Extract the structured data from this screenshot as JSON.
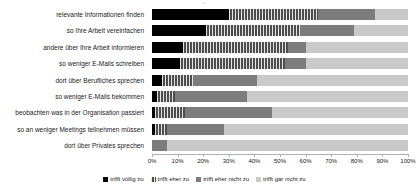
{
  "chart_data": {
    "type": "bar",
    "orientation": "horizontal",
    "stacked": true,
    "stack_mode": "percent",
    "title": "",
    "xlabel": "",
    "ylabel": "",
    "xlim": [
      0,
      100
    ],
    "grid": false,
    "legend_position": "bottom",
    "tick_labels": [
      "0%",
      "10%",
      "20%",
      "30%",
      "40%",
      "50%",
      "60%",
      "70%",
      "80%",
      "90%",
      "100%"
    ],
    "tick_values": [
      0,
      10,
      20,
      30,
      40,
      50,
      60,
      70,
      80,
      90,
      100
    ],
    "categories": [
      "relevante Informationen finden",
      "so Ihre Arbeit vereinfachen",
      "andere über Ihre Arbeit informieren",
      "so weniger E-Mails schreiben",
      "dort über Berufliches sprechen",
      "so weniger E-Mails bekommen",
      "beobachten was in der Organisation passiert",
      "so an weniger Meetings teilnehmen müssen",
      "dort über Privates sprechen"
    ],
    "series": [
      {
        "name": "trifft völlig zu",
        "color": "#000000",
        "values": [
          30,
          21,
          12,
          11,
          4,
          2,
          1,
          1,
          0
        ]
      },
      {
        "name": "trifft eher zu",
        "color": "#4d4d4d",
        "values": [
          35,
          37,
          41,
          41,
          12,
          7,
          12,
          5,
          0
        ]
      },
      {
        "name": "trifft eher nicht zu",
        "color": "#7c7c7c",
        "values": [
          22,
          21,
          7,
          8,
          25,
          28,
          34,
          22,
          6
        ]
      },
      {
        "name": "trifft gar nicht zu",
        "color": "#c9c9c9",
        "values": [
          13,
          21,
          40,
          40,
          59,
          63,
          53,
          72,
          94
        ]
      }
    ]
  },
  "legend": {
    "items": [
      {
        "label": "trifft völlig zu"
      },
      {
        "label": "trifft eher zu"
      },
      {
        "label": "trifft eher nicht zu"
      },
      {
        "label": "trifft gar nicht zu"
      }
    ]
  }
}
